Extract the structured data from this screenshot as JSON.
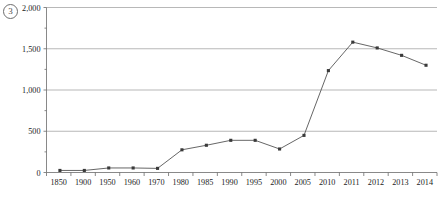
{
  "figure": {
    "index_badge": "3"
  },
  "chart_data": {
    "type": "line",
    "title": "",
    "subtitle": "",
    "xlabel": "",
    "ylabel": "",
    "categories": [
      "1850",
      "1900",
      "1950",
      "1960",
      "1970",
      "1980",
      "1985",
      "1990",
      "1995",
      "2000",
      "2005",
      "2010",
      "2011",
      "2012",
      "2013",
      "2014"
    ],
    "values": [
      25,
      25,
      55,
      55,
      50,
      275,
      330,
      390,
      390,
      285,
      450,
      1235,
      1580,
      1510,
      1420,
      1300
    ],
    "series": [
      {
        "name": "",
        "values": [
          25,
          25,
          55,
          55,
          50,
          275,
          330,
          390,
          390,
          285,
          450,
          1235,
          1580,
          1510,
          1420,
          1300
        ]
      }
    ],
    "ylim": [
      0,
      2000
    ],
    "y_ticks": [
      0,
      500,
      1000,
      1500,
      2000
    ],
    "y_tick_labels": [
      "0",
      "500",
      "1,000",
      "1,500",
      "2,000"
    ],
    "grid": true,
    "grid_axis": "y",
    "legend": "none",
    "marker": "square",
    "line_color": "#555555",
    "marker_color": "#3a3a3a",
    "grid_color": "#9a9a9a",
    "axis_color": "#6b6b6b",
    "background_color": "#ffffff"
  }
}
